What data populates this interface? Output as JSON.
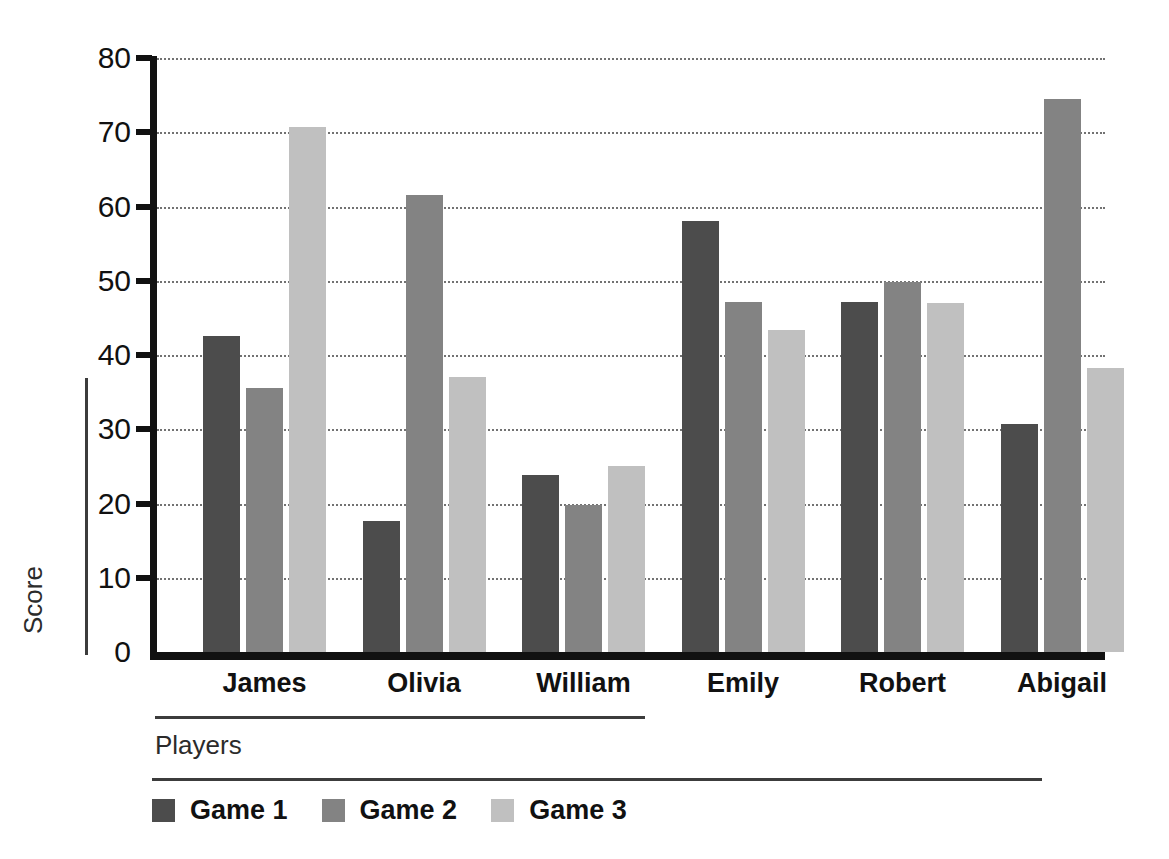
{
  "chart_data": {
    "type": "bar",
    "title": "",
    "xlabel": "Players",
    "ylabel": "Score",
    "categories": [
      "James",
      "Olivia",
      "William",
      "Emily",
      "Robert",
      "Abigail"
    ],
    "series": [
      {
        "name": "Game 1",
        "color": "#4c4c4c",
        "values": [
          42.5,
          17.7,
          23.8,
          58.0,
          47.2,
          30.7
        ]
      },
      {
        "name": "Game 2",
        "color": "#838383",
        "values": [
          35.5,
          61.5,
          19.8,
          47.2,
          49.8,
          74.5
        ]
      },
      {
        "name": "Game 3",
        "color": "#c0c0c0",
        "values": [
          70.7,
          37.0,
          25.1,
          43.4,
          47.0,
          38.2
        ]
      }
    ],
    "ylim": [
      0,
      80
    ],
    "yticks": [
      0,
      10,
      20,
      30,
      40,
      50,
      60,
      70,
      80
    ],
    "ytick_labels": [
      "0",
      "10",
      "20",
      "30",
      "40",
      "50",
      "60",
      "70",
      "80"
    ],
    "grid": "horizontal-dotted",
    "legend_position": "bottom-left",
    "legend_entries": [
      "Game 1",
      "Game 2",
      "Game 3"
    ],
    "background": "#ffffff",
    "axis_color": "#111111",
    "gridline_color": "#5a5a5a"
  }
}
